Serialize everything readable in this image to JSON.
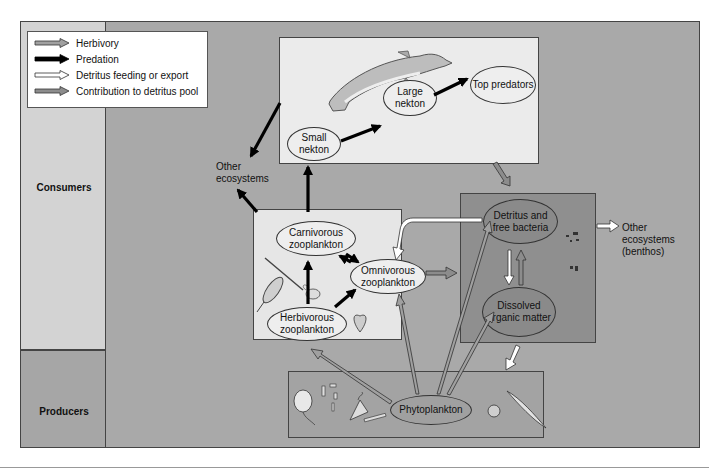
{
  "legend": {
    "items": [
      {
        "label": "Herbivory",
        "style": "herbivory",
        "fill": "#a0a0a0"
      },
      {
        "label": "Predation",
        "style": "predation",
        "fill": "#000000"
      },
      {
        "label": "Detritus feeding or export",
        "style": "detritus",
        "fill": "#ffffff"
      },
      {
        "label": "Contribution to detritus pool",
        "style": "contribution",
        "fill": "#8c8c8c"
      }
    ]
  },
  "bands": {
    "consumers": "Consumers",
    "producers": "Producers"
  },
  "nodes": {
    "small_nekton": "Small nekton",
    "large_nekton": "Large nekton",
    "top_predators": "Top predators",
    "carnivorous_zooplankton": "Carnivorous zooplankton",
    "omnivorous_zooplankton": "Omnivorous zooplankton",
    "herbivorous_zooplankton": "Herbivorous zooplankton",
    "detritus_bacteria": "Detritus and free bacteria",
    "dissolved_organic_matter": "Dissolved organic matter",
    "phytoplankton": "Phytoplankton"
  },
  "external": {
    "other_ecosystems": "Other ecosystems",
    "other_ecosystems_benthos_1": "Other",
    "other_ecosystems_benthos_2": "ecosystems",
    "other_ecosystems_benthos_3": "(benthos)"
  },
  "colors": {
    "frame_bg": "#a9a9a9",
    "consumers_band": "#d3d3d3",
    "producers_band": "#a6a6a6",
    "nekton_panel": "#ebebeb",
    "zooplankton_panel": "#e6e6e6",
    "detritus_panel": "#8f8f8f",
    "phyto_panel": "#a3a3a3"
  }
}
